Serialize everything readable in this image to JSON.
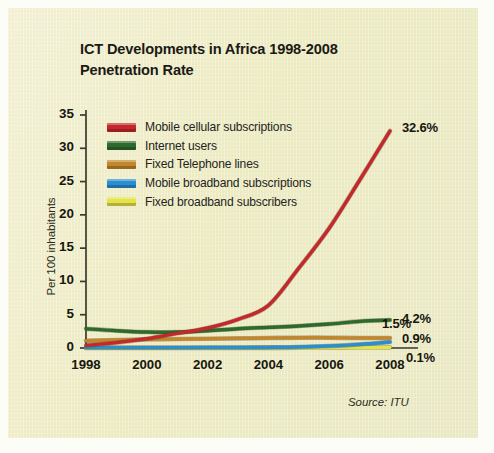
{
  "figure": {
    "background_color": "#eeeccc",
    "title_line1": "ICT Developments in Africa 1998-2008",
    "title_line2": "Penetration Rate",
    "source_note": "Source: ITU"
  },
  "chart_data": {
    "type": "line",
    "title": "ICT Developments in Africa 1998-2008 Penetration Rate",
    "xlabel": "",
    "ylabel": "Per 100 inhabitants",
    "xlim": [
      1998,
      2008
    ],
    "ylim": [
      0,
      35
    ],
    "grid": false,
    "legend_position": "upper-left-inside",
    "x": [
      1998,
      1999,
      2000,
      2001,
      2002,
      2003,
      2004,
      2005,
      2006,
      2007,
      2008
    ],
    "xticks": [
      "1998",
      "2000",
      "2002",
      "2004",
      "2006",
      "2008"
    ],
    "xtick_values": [
      1998,
      2000,
      2002,
      2004,
      2006,
      2008
    ],
    "yticks": [
      "0",
      "5",
      "10",
      "15",
      "20",
      "25",
      "30",
      "35"
    ],
    "ytick_values": [
      0,
      5,
      10,
      15,
      20,
      25,
      30,
      35
    ],
    "series": [
      {
        "name": "Mobile cellular subscriptions",
        "color": "#c4282a",
        "end_label": "32.6%",
        "end_value": 32.6,
        "values": [
          0.4,
          0.8,
          1.4,
          2.2,
          3.0,
          4.3,
          6.4,
          12.0,
          18.0,
          25.2,
          32.6
        ]
      },
      {
        "name": "Internet users",
        "color": "#2d6b2c",
        "end_label": "4.2%",
        "end_value": 4.2,
        "values": [
          2.9,
          2.6,
          2.4,
          2.4,
          2.6,
          2.9,
          3.1,
          3.3,
          3.6,
          4.0,
          4.2
        ]
      },
      {
        "name": "Fixed Telephone lines",
        "color": "#c2862c",
        "end_label": "1.5%",
        "end_value": 1.5,
        "values": [
          1.1,
          1.2,
          1.3,
          1.35,
          1.4,
          1.45,
          1.5,
          1.55,
          1.55,
          1.5,
          1.5
        ]
      },
      {
        "name": "Mobile broadband subscriptions",
        "color": "#2a8fd0",
        "end_label": "0.9%",
        "end_value": 0.9,
        "values": [
          0.05,
          0.05,
          0.05,
          0.06,
          0.07,
          0.08,
          0.1,
          0.15,
          0.3,
          0.55,
          0.9
        ]
      },
      {
        "name": "Fixed broadband subscribers",
        "color": "#e4e44a",
        "end_label": "0.1%",
        "end_value": 0.1,
        "values": [
          0.0,
          0.0,
          0.0,
          0.0,
          0.01,
          0.01,
          0.02,
          0.03,
          0.05,
          0.07,
          0.1
        ]
      }
    ]
  }
}
